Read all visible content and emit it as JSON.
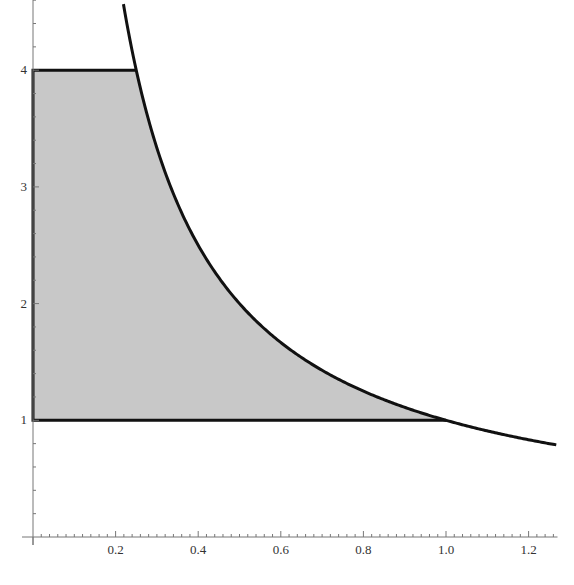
{
  "chart_data": {
    "type": "area",
    "title": "",
    "xlabel": "",
    "ylabel": "",
    "xlim": [
      0,
      1.27
    ],
    "ylim": [
      0,
      4.6
    ],
    "grid": false,
    "legend": null,
    "x_ticks": [
      "0.2",
      "0.4",
      "0.6",
      "0.8",
      "1.0",
      "1.2"
    ],
    "x_tick_values": [
      0.2,
      0.4,
      0.6,
      0.8,
      1.0,
      1.2
    ],
    "y_ticks": [
      "1",
      "2",
      "3",
      "4"
    ],
    "y_tick_values": [
      1,
      2,
      3,
      4
    ],
    "series": [
      {
        "name": "curve y = 1/x",
        "type": "line",
        "function": "1/x",
        "x": [
          0.219,
          0.25,
          0.3,
          0.4,
          0.5,
          0.6,
          0.7,
          0.8,
          0.9,
          1.0,
          1.1,
          1.2,
          1.27
        ],
        "y": [
          4.57,
          4.0,
          3.33,
          2.5,
          2.0,
          1.67,
          1.43,
          1.25,
          1.11,
          1.0,
          0.91,
          0.83,
          0.79
        ],
        "color": "#111111"
      },
      {
        "name": "shaded region",
        "type": "area",
        "description": "Region bounded by x=0, y=1, y=4 and y=1/x",
        "boundary": {
          "x_min": 0,
          "y_min": 1,
          "y_max": 4,
          "right": "1/x"
        },
        "corners": [
          [
            0,
            1
          ],
          [
            0,
            4
          ],
          [
            0.25,
            4
          ],
          [
            1.0,
            1
          ]
        ],
        "fill": "#c8c8c8",
        "outline": "#111111"
      }
    ]
  }
}
